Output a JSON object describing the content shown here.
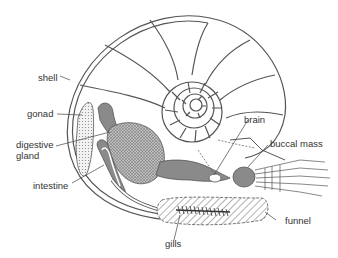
{
  "diagram": {
    "labels": {
      "shell": "shell",
      "gonad": "gonad",
      "digestive_gland_1": "digestive",
      "digestive_gland_2": "gland",
      "intestine": "intestine",
      "brain": "brain",
      "buccal_mass": "buccal mass",
      "funnel": "funnel",
      "gills": "gills"
    },
    "colors": {
      "line": "#555555",
      "text": "#333333",
      "fill_dark": "#8a8a8a",
      "fill_light": "#d8d8d8",
      "background": "#ffffff"
    }
  }
}
